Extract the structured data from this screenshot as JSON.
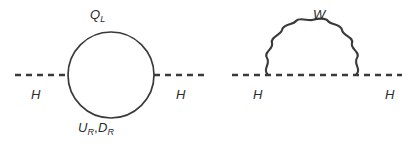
{
  "figure": {
    "background_color": "#ffffff",
    "line_color": "#3a3a3a",
    "text_color": "#2b2b2b",
    "width": 416,
    "height": 149
  },
  "diagrams": [
    {
      "name": "fermion-loop",
      "loop_type": "solid-circle",
      "external_line_type": "dashed",
      "labels": {
        "top": {
          "base": "Q",
          "sub": "L"
        },
        "bottom_first": {
          "base": "U",
          "sub": "R"
        },
        "bottom_separator": ",",
        "bottom_second": {
          "base": "D",
          "sub": "R"
        },
        "incoming": "H",
        "outgoing": "H"
      }
    },
    {
      "name": "w-loop",
      "loop_type": "wavy-arch",
      "external_line_type": "dashed",
      "labels": {
        "top": {
          "base": "W",
          "sub": ""
        },
        "incoming": "H",
        "outgoing": "H"
      }
    }
  ]
}
